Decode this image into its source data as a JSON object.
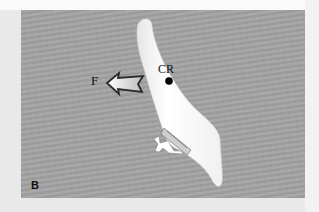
{
  "figure": {
    "panel_label": "B",
    "force_label": "F",
    "center_label": "CR",
    "background_color": "#a3a3a3",
    "tooth_color": "#fbfbfb",
    "marker_color": "#000000"
  }
}
